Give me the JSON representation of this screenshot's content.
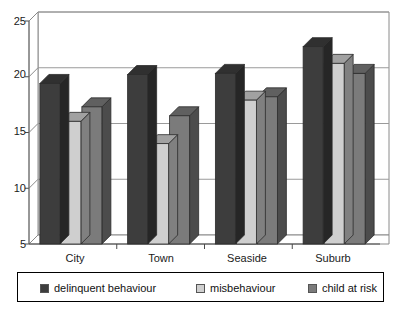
{
  "chart_data": {
    "type": "bar",
    "title": "",
    "subtitle": "",
    "xlabel": "",
    "ylabel": "",
    "categories": [
      "City",
      "Town",
      "Seaside",
      "Suburb"
    ],
    "series": [
      {
        "name": "delinquent behaviour",
        "color": "#3d3d3d",
        "values": [
          19.4,
          20.2,
          20.3,
          22.7
        ]
      },
      {
        "name": "misbehaviour",
        "color": "#cfcfcf",
        "values": [
          16.0,
          14.0,
          17.9,
          21.2
        ]
      },
      {
        "name": "child at risk",
        "color": "#7b7b7b",
        "values": [
          17.3,
          16.5,
          18.2,
          20.3
        ]
      }
    ],
    "ylim": [
      5,
      25
    ],
    "yticks": [
      5,
      10,
      15,
      20,
      25
    ],
    "ytick_labels": [
      "5",
      "10",
      "15",
      "20",
      "25"
    ],
    "grid": true,
    "grid_axis": "y",
    "legend_position": "bottom",
    "style": "3d-bars"
  },
  "axes": {
    "y_labels": [
      "25",
      "20",
      "15",
      "10",
      "5"
    ],
    "x_labels": [
      "City",
      "Town",
      "Seaside",
      "Suburb"
    ]
  },
  "legend": {
    "items": [
      {
        "label": "delinquent behaviour",
        "color": "#3d3d3d"
      },
      {
        "label": "misbehaviour",
        "color": "#cfcfcf"
      },
      {
        "label": "child at risk",
        "color": "#7b7b7b"
      }
    ]
  }
}
